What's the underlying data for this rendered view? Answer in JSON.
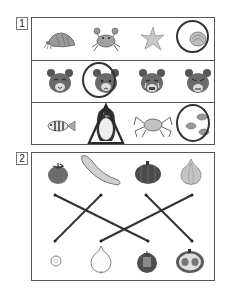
{
  "sections": [
    {
      "number": "1",
      "rows": [
        {
          "items": [
            "hermit-crab",
            "crab",
            "starfish",
            "seashell"
          ],
          "circled_index": 3
        },
        {
          "items": [
            "bear-smiling",
            "bear-sad",
            "bear-crying",
            "bear-angry"
          ],
          "circled_index": 1
        },
        {
          "items": [
            "striped-fish",
            "penguin",
            "king-crab",
            "fish-group"
          ],
          "circled_index": 3,
          "triangle_index": 1
        }
      ]
    },
    {
      "number": "2",
      "top_items": [
        "tomato",
        "cucumber",
        "pumpkin",
        "onion"
      ],
      "bottom_items": [
        "cucumber-slice",
        "onion-whole",
        "tomato-cut",
        "pumpkin-half"
      ],
      "lines": [
        {
          "from": "top-1",
          "to": "bottom-3"
        },
        {
          "from": "top-2",
          "to": "bottom-1"
        },
        {
          "from": "top-3",
          "to": "bottom-4"
        },
        {
          "from": "top-4",
          "to": "bottom-2"
        }
      ]
    }
  ],
  "colors": {
    "border": "#555555",
    "ink": "#333333",
    "mark": "#2a2a2a"
  }
}
